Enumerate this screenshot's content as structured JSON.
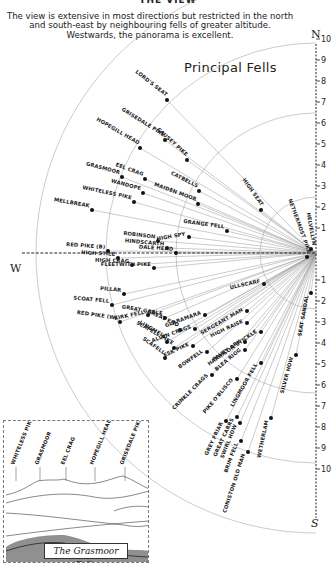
{
  "page": {
    "cut_title": "THE VIEW",
    "intro": "The view is extensive in most directions but restricted in the north and south-east by neighbouring fells of greater altitude. Westwards, the panorama is excellent.",
    "heading": "Principal Fells"
  },
  "compass": {
    "north": "N",
    "south": "S",
    "west": "W"
  },
  "axis": {
    "center": [
      316,
      253
    ],
    "north_ticks": [
      "1",
      "2",
      "3",
      "4",
      "5",
      "6",
      "7",
      "8",
      "9",
      "10"
    ],
    "south_ticks": [
      "1",
      "2",
      "3",
      "4",
      "5",
      "6",
      "7",
      "8",
      "9",
      "10"
    ],
    "unit_px": 28
  },
  "arcs_miles": [
    2,
    5,
    7.5,
    10
  ],
  "fells": [
    {
      "name": "LORD'S SEAT",
      "dot": [
        167,
        100
      ],
      "angle": 38
    },
    {
      "name": "GRISEDALE PIKE",
      "dot": [
        165,
        140
      ],
      "angle": 32
    },
    {
      "name": "HOPEGILL HEAD",
      "dot": [
        140,
        148
      ],
      "angle": 30
    },
    {
      "name": "CAUSEY PIKE",
      "dot": [
        187,
        160
      ],
      "angle": 42
    },
    {
      "name": "CATBELLS",
      "dot": [
        199,
        191
      ],
      "angle": 27
    },
    {
      "name": "MAIDEN MOOR",
      "dot": [
        198,
        204
      ],
      "angle": 20
    },
    {
      "name": "EEL CRAG",
      "dot": [
        145,
        179
      ],
      "angle": 20
    },
    {
      "name": "GRASMOOR",
      "dot": [
        122,
        177
      ],
      "angle": 15
    },
    {
      "name": "WANDOPE",
      "dot": [
        143,
        193
      ],
      "angle": 15
    },
    {
      "name": "WHITELESS PIKE",
      "dot": [
        134,
        202
      ],
      "angle": 12
    },
    {
      "name": "MELLBREAK",
      "dot": [
        92,
        210
      ],
      "angle": 10
    },
    {
      "name": "GRANGE FELL",
      "dot": [
        227,
        231
      ],
      "angle": 8
    },
    {
      "name": "HIGH SEAT",
      "dot": [
        261,
        210
      ],
      "angle": 55
    },
    {
      "name": "NETHERMOST PIKE",
      "dot": [
        307,
        257
      ],
      "angle": 70
    },
    {
      "name": "HELVELLYN",
      "dot": [
        311,
        249
      ],
      "angle": 80
    },
    {
      "name": "HIGH SPY",
      "dot": [
        189,
        237
      ],
      "angle": -10
    },
    {
      "name": "ROBINSON",
      "dot": [
        158,
        241
      ],
      "angle": 7
    },
    {
      "name": "HINDSCARTH",
      "dot": [
        167,
        248
      ],
      "angle": 5
    },
    {
      "name": "DALE HEAD",
      "dot": [
        176,
        253
      ],
      "angle": 4
    },
    {
      "name": "RED PIKE (B)",
      "dot": [
        108,
        251
      ],
      "angle": 4
    },
    {
      "name": "HIGH STILE",
      "dot": [
        118,
        258
      ],
      "angle": 3
    },
    {
      "name": "HIGH CRAG",
      "dot": [
        132,
        265
      ],
      "angle": 2
    },
    {
      "name": "FLEETWITH PIKE",
      "dot": [
        154,
        268
      ],
      "angle": 0
    },
    {
      "name": "PILLAR",
      "dot": [
        124,
        294
      ],
      "angle": 5
    },
    {
      "name": "SCOAT FELL",
      "dot": [
        112,
        305
      ],
      "angle": 5
    },
    {
      "name": "RED PIKE (W)",
      "dot": [
        120,
        322
      ],
      "angle": 8
    },
    {
      "name": "KIRK FELL",
      "dot": [
        148,
        315
      ],
      "angle": -12
    },
    {
      "name": "GREAT GABLE",
      "dot": [
        165,
        318
      ],
      "angle": 10
    },
    {
      "name": "ULLSCARF",
      "dot": [
        264,
        284
      ],
      "angle": -12
    },
    {
      "name": "GLARAMARA",
      "dot": [
        205,
        315
      ],
      "angle": -20
    },
    {
      "name": "ALLEN CRAGS",
      "dot": [
        195,
        329
      ],
      "angle": -20
    },
    {
      "name": "SERGEANT MAN",
      "dot": [
        247,
        311
      ],
      "angle": -30
    },
    {
      "name": "HIGH RAISE",
      "dot": [
        247,
        323
      ],
      "angle": -25
    },
    {
      "name": "GREAT END",
      "dot": [
        180,
        330
      ],
      "angle": 25
    },
    {
      "name": "LINGMELL",
      "dot": [
        167,
        342
      ],
      "angle": 30
    },
    {
      "name": "SCAFELL PIKE",
      "dot": [
        174,
        348
      ],
      "angle": 30
    },
    {
      "name": "ESK PIKE",
      "dot": [
        193,
        346
      ],
      "angle": -25
    },
    {
      "name": "SCAFELL",
      "dot": [
        165,
        358
      ],
      "angle": 35
    },
    {
      "name": "BOWFELL",
      "dot": [
        207,
        352
      ],
      "angle": -35
    },
    {
      "name": "HARRISON STICKLE",
      "dot": [
        261,
        332
      ],
      "angle": -35
    },
    {
      "name": "PAVEY ARK",
      "dot": [
        245,
        342
      ],
      "angle": -35
    },
    {
      "name": "BLEA RIGG",
      "dot": [
        245,
        350
      ],
      "angle": -40
    },
    {
      "name": "SEAT SANDAL",
      "dot": [
        311,
        293
      ],
      "angle": -80
    },
    {
      "name": "SILVER HOW",
      "dot": [
        296,
        355
      ],
      "angle": -75
    },
    {
      "name": "LINGMOOR FELL",
      "dot": [
        261,
        363
      ],
      "angle": -60
    },
    {
      "name": "CRINKLE CRAGS",
      "dot": [
        212,
        375
      ],
      "angle": -45
    },
    {
      "name": "PIKE O'BLISCO",
      "dot": [
        237,
        379
      ],
      "angle": -50
    },
    {
      "name": "GREY FRIAR",
      "dot": [
        226,
        421
      ],
      "angle": -65
    },
    {
      "name": "GREAT CARRS",
      "dot": [
        237,
        417
      ],
      "angle": -65
    },
    {
      "name": "SWIRL HOW",
      "dot": [
        240,
        423
      ],
      "angle": -68
    },
    {
      "name": "BRIM FELL",
      "dot": [
        241,
        441
      ],
      "angle": -70
    },
    {
      "name": "CONISTON OLD MAN",
      "dot": [
        248,
        452
      ],
      "angle": -72
    },
    {
      "name": "WETHERLAM",
      "dot": [
        271,
        418
      ],
      "angle": -78
    }
  ],
  "sketch": {
    "caption": "The Grasmoor Fells",
    "peaks": [
      {
        "name": "WHITELESS PIKE",
        "x": 10
      },
      {
        "name": "GRASMOOR",
        "x": 34
      },
      {
        "name": "EEL CRAG",
        "x": 60
      },
      {
        "name": "HOPEGILL HEAD",
        "x": 89
      },
      {
        "name": "GRISEDALE PIKE",
        "x": 119
      }
    ]
  }
}
